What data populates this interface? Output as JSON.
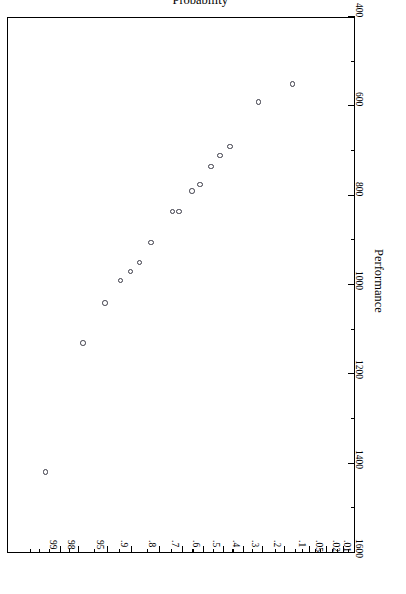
{
  "chart_data": {
    "type": "scatter",
    "title": "",
    "subtitle": "",
    "xlabel": "Probability",
    "ylabel": "Performance",
    "orientation": "rotated-180",
    "grid": false,
    "legend": null,
    "x_scale": "normal-probability",
    "x_tick_labels": [
      "01",
      "02",
      "05",
      "1",
      "2",
      "3",
      "4",
      "5",
      "6",
      "7",
      "8",
      "9",
      "95",
      "98",
      "99"
    ],
    "x_tick_values": [
      0.01,
      0.02,
      0.05,
      0.1,
      0.2,
      0.3,
      0.4,
      0.5,
      0.6,
      0.7,
      0.8,
      0.9,
      0.95,
      0.98,
      0.99
    ],
    "xlim": [
      0.01,
      0.99
    ],
    "y_tick_labels": [
      "400",
      "600",
      "800",
      "1000",
      "1200",
      "1400",
      "1600"
    ],
    "y_tick_values": [
      400,
      600,
      800,
      1000,
      1200,
      1400,
      1600
    ],
    "ylim": [
      400,
      1600
    ],
    "points": [
      {
        "probability": 0.965,
        "performance": 1418
      },
      {
        "probability": 0.905,
        "performance": 1130
      },
      {
        "probability": 0.845,
        "performance": 1040
      },
      {
        "probability": 0.79,
        "performance": 990
      },
      {
        "probability": 0.75,
        "performance": 970
      },
      {
        "probability": 0.71,
        "performance": 950
      },
      {
        "probability": 0.655,
        "performance": 905
      },
      {
        "probability": 0.545,
        "performance": 835
      },
      {
        "probability": 0.51,
        "performance": 835
      },
      {
        "probability": 0.44,
        "performance": 790
      },
      {
        "probability": 0.4,
        "performance": 775
      },
      {
        "probability": 0.345,
        "performance": 735
      },
      {
        "probability": 0.3,
        "performance": 710
      },
      {
        "probability": 0.255,
        "performance": 690
      },
      {
        "probability": 0.15,
        "performance": 590
      },
      {
        "probability": 0.068,
        "performance": 550
      }
    ],
    "point_count": 16,
    "marker": "open-circle"
  },
  "axes": {
    "x": {
      "title": "Probability",
      "ticks": [
        {
          "label": "01",
          "pos_pct": 0.0
        },
        {
          "label": "02",
          "pos_pct": 3.2
        },
        {
          "label": "05",
          "pos_pct": 8.1
        },
        {
          "label": "1",
          "pos_pct": 13.0
        },
        {
          "label": "2",
          "pos_pct": 20.2
        },
        {
          "label": "3",
          "pos_pct": 26.3
        },
        {
          "label": "4",
          "pos_pct": 32.0
        },
        {
          "label": "5",
          "pos_pct": 37.7
        },
        {
          "label": "6",
          "pos_pct": 43.4
        },
        {
          "label": "7",
          "pos_pct": 49.4
        },
        {
          "label": "8",
          "pos_pct": 56.0
        },
        {
          "label": "9",
          "pos_pct": 64.0
        },
        {
          "label": "95",
          "pos_pct": 71.0
        },
        {
          "label": "98",
          "pos_pct": 79.4
        },
        {
          "label": "99",
          "pos_pct": 84.5
        }
      ],
      "minor_ticks_pct": [
        1.6,
        4.8,
        6.4,
        9.7,
        11.3,
        15.0,
        17.0,
        22.8,
        29.2,
        34.9,
        40.6,
        46.4,
        52.5,
        59.5,
        67.4,
        74.8,
        82.0,
        87.5,
        90.5,
        93.0
      ]
    },
    "y": {
      "title": "Performance",
      "ticks": [
        {
          "label": "400",
          "pos_pct": 0.0
        },
        {
          "label": "600",
          "pos_pct": 16.67
        },
        {
          "label": "800",
          "pos_pct": 33.33
        },
        {
          "label": "1000",
          "pos_pct": 50.0
        },
        {
          "label": "1200",
          "pos_pct": 66.67
        },
        {
          "label": "1400",
          "pos_pct": 83.33
        },
        {
          "label": "1600",
          "pos_pct": 100.0
        }
      ],
      "minor_ticks_pct": [
        8.33,
        25.0,
        41.67,
        58.33,
        75.0,
        91.67
      ]
    }
  },
  "colors": {
    "background": "#ffffff",
    "frame": "#000000",
    "marker_stroke": "#3a3a46",
    "text": "#000000"
  }
}
